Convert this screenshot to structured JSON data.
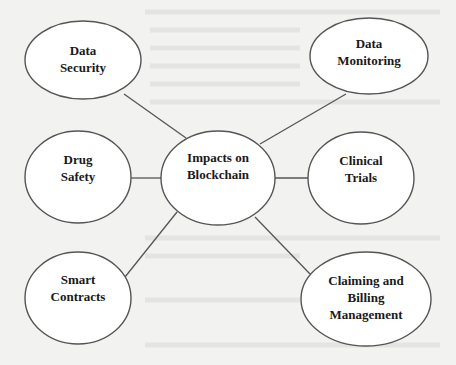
{
  "diagram": {
    "type": "mind-map",
    "center": {
      "id": "impacts",
      "label_line1": "Impacts on",
      "label_line2": "Blockchain"
    },
    "nodes": [
      {
        "id": "data-security",
        "label_line1": "Data",
        "label_line2": "Security"
      },
      {
        "id": "data-monitoring",
        "label_line1": "Data",
        "label_line2": "Monitoring"
      },
      {
        "id": "drug-safety",
        "label_line1": "Drug",
        "label_line2": "Safety"
      },
      {
        "id": "clinical-trials",
        "label_line1": "Clinical",
        "label_line2": "Trials"
      },
      {
        "id": "smart-contracts",
        "label_line1": "Smart",
        "label_line2": "Contracts"
      },
      {
        "id": "claiming-billing",
        "label_line1": "Claiming and",
        "label_line2": "Billing",
        "label_line3": "Management"
      }
    ],
    "edges": [
      [
        "impacts",
        "data-security"
      ],
      [
        "impacts",
        "data-monitoring"
      ],
      [
        "impacts",
        "drug-safety"
      ],
      [
        "impacts",
        "clinical-trials"
      ],
      [
        "impacts",
        "smart-contracts"
      ],
      [
        "impacts",
        "claiming-billing"
      ]
    ],
    "colors": {
      "stroke": "#555555",
      "fill": "#ffffff",
      "background": "#f2f2f0",
      "text": "#1a1a1a"
    }
  }
}
